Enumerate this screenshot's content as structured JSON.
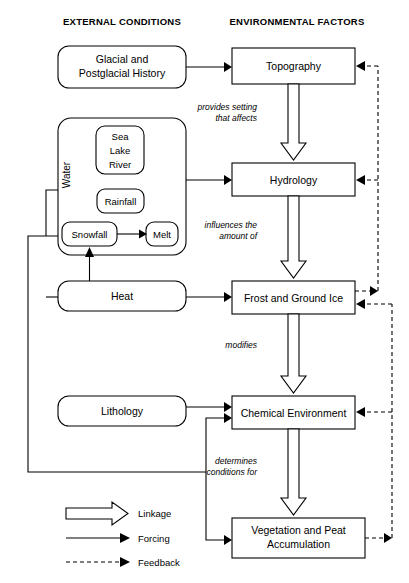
{
  "headings": {
    "left": "EXTERNAL CONDITIONS",
    "right": "ENVIRONMENTAL FACTORS"
  },
  "external_nodes": {
    "glacial": {
      "line1": "Glacial and",
      "line2": "Postglacial History"
    },
    "water_group_label": "Water",
    "sea_lake_river": {
      "line1": "Sea",
      "line2": "Lake",
      "line3": "River"
    },
    "rainfall": "Rainfall",
    "snowfall": "Snowfall",
    "melt": "Melt",
    "heat": "Heat",
    "lithology": "Lithology"
  },
  "environmental_nodes": {
    "topography": "Topography",
    "hydrology": "Hydrology",
    "frost": "Frost and Ground Ice",
    "chemical": "Chemical Environment",
    "vegetation": {
      "line1": "Vegetation and Peat",
      "line2": "Accumulation"
    }
  },
  "edge_labels": {
    "topo_to_hydro": {
      "line1": "provides setting",
      "line2": "that affects"
    },
    "hydro_to_frost": {
      "line1": "influences the",
      "line2": "amount of"
    },
    "frost_to_chem": {
      "line1": "modifies"
    },
    "chem_to_veg": {
      "line1": "determines",
      "line2": "conditions for"
    }
  },
  "legend": {
    "linkage": "Linkage",
    "forcing": "Forcing",
    "feedback": "Feedback"
  },
  "colors": {
    "stroke": "#000000",
    "fill": "#ffffff",
    "text": "#000000"
  }
}
